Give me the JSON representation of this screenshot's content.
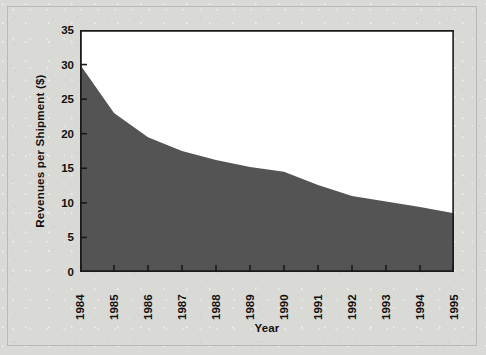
{
  "chart_data": {
    "type": "area",
    "title": "",
    "xlabel": "Year",
    "ylabel": "Revenues per Shipment ($)",
    "categories": [
      "1984",
      "1985",
      "1986",
      "1987",
      "1988",
      "1989",
      "1990",
      "1991",
      "1992",
      "1993",
      "1994",
      "1995"
    ],
    "values": [
      30.0,
      23.0,
      19.5,
      17.5,
      16.2,
      15.2,
      14.5,
      12.6,
      11.0,
      10.2,
      9.4,
      8.5
    ],
    "x": [
      1984,
      1985,
      1986,
      1987,
      1988,
      1989,
      1990,
      1991,
      1992,
      1993,
      1994,
      1995
    ],
    "ylim": [
      0,
      35
    ],
    "xlim": [
      1984,
      1995
    ],
    "yticks": [
      0,
      5,
      10,
      15,
      20,
      25,
      30,
      35
    ],
    "ytick_labels": [
      "0",
      "5",
      "10",
      "15",
      "20",
      "25",
      "30",
      "35"
    ],
    "grid": false,
    "legend": false,
    "legend_position": "none",
    "series": [
      {
        "name": "Revenues per Shipment ($)",
        "values": [
          30.0,
          23.0,
          19.5,
          17.5,
          16.2,
          15.2,
          14.5,
          12.6,
          11.0,
          10.2,
          9.4,
          8.5
        ]
      }
    ],
    "colors": {
      "area_fill": "#545454",
      "plot_background": "#ffffff",
      "figure_background": "#d9d9d6",
      "axis": "#1a1a1a",
      "text": "#111111"
    }
  }
}
